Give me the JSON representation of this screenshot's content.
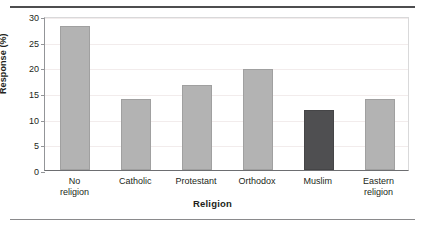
{
  "chart_data": {
    "type": "bar",
    "title": "",
    "subtitle": "",
    "xlabel": "Religion",
    "ylabel": "Response (%)",
    "categories": [
      "No religion",
      "Catholic",
      "Protestant",
      "Orthodox",
      "Muslim",
      "Eastern religion"
    ],
    "category_lines": [
      [
        "No",
        "religion"
      ],
      [
        "Catholic"
      ],
      [
        "Protestant"
      ],
      [
        "Orthodox"
      ],
      [
        "Muslim"
      ],
      [
        "Eastern",
        "religion"
      ]
    ],
    "values": [
      28.0,
      13.9,
      16.5,
      19.7,
      11.6,
      13.8
    ],
    "ylim": [
      0,
      30
    ],
    "yticks": [
      0,
      5,
      10,
      15,
      20,
      25,
      30
    ],
    "ytick_labels": [
      "0",
      "5",
      "10",
      "15",
      "20",
      "25",
      "30"
    ],
    "grid": true,
    "grid_axis": "y",
    "legend": "none",
    "bar_colors": [
      "#b3b3b3",
      "#b3b3b3",
      "#b3b3b3",
      "#b3b3b3",
      "#4f4f51",
      "#b3b3b3"
    ],
    "highlight_category": "Muslim",
    "colors": {
      "bar_default": "#b3b3b3",
      "bar_highlight": "#4f4f51",
      "axis": "#6d6e71",
      "grid": "#f2ecec",
      "text": "#231f20",
      "rule": "#58585a",
      "background": "#ffffff"
    }
  }
}
